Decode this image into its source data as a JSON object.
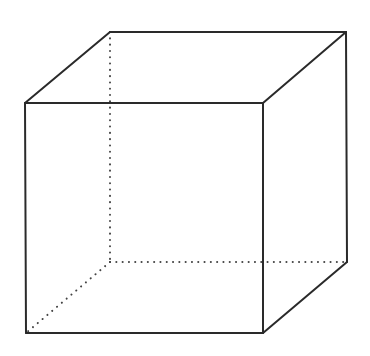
{
  "diagram": {
    "type": "wireframe-cube",
    "colors": {
      "background": "#ffffff",
      "visible_edge": "#2a2a2a",
      "hidden_edge": "#444444"
    },
    "vertices": {
      "front_top_left": [
        25,
        103
      ],
      "front_top_right": [
        263,
        103
      ],
      "front_bottom_left": [
        26,
        333
      ],
      "front_bottom_right": [
        263,
        333
      ],
      "back_top_left": [
        110,
        32
      ],
      "back_top_right": [
        346,
        32
      ],
      "back_bottom_left": [
        110,
        262
      ],
      "back_bottom_right": [
        347,
        262
      ]
    },
    "visible_edges": [
      [
        "front_top_left",
        "front_top_right"
      ],
      [
        "front_top_right",
        "front_bottom_right"
      ],
      [
        "front_bottom_right",
        "front_bottom_left"
      ],
      [
        "front_bottom_left",
        "front_top_left"
      ],
      [
        "front_top_left",
        "back_top_left"
      ],
      [
        "back_top_left",
        "back_top_right"
      ],
      [
        "back_top_right",
        "front_top_right"
      ],
      [
        "back_top_right",
        "back_bottom_right"
      ],
      [
        "back_bottom_right",
        "front_bottom_right"
      ]
    ],
    "hidden_edges": [
      [
        "back_top_left",
        "back_bottom_left"
      ],
      [
        "back_bottom_left",
        "back_bottom_right"
      ],
      [
        "back_bottom_left",
        "front_bottom_left"
      ]
    ]
  }
}
